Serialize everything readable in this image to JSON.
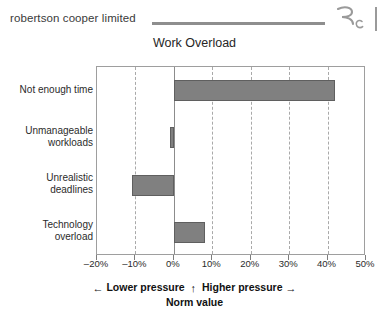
{
  "header": {
    "brand": "robertson cooper limited",
    "logo_letter_r": "R",
    "logo_letter_c": "C"
  },
  "chart_data": {
    "type": "bar",
    "orientation": "horizontal",
    "title": "Work Overload",
    "xlabel": "Norm value",
    "ylabel": "",
    "categories": [
      "Not enough time",
      "Unmanageable workloads",
      "Unrealistic deadlines",
      "Technology overload"
    ],
    "values": [
      42,
      -1,
      -11,
      8
    ],
    "xlim": [
      -20,
      50
    ],
    "xticks": [
      -20,
      -10,
      0,
      10,
      20,
      30,
      40,
      50
    ],
    "xticklabels": [
      "–20%",
      "–10%",
      "0%",
      "10%",
      "20%",
      "30%",
      "40%",
      "50%"
    ],
    "grid": true,
    "gridlines_at": [
      -10,
      10,
      20,
      30,
      40
    ],
    "legend": null,
    "bar_color": "#808080",
    "bar_edge_color": "#5f5f5f",
    "annotations": {
      "lower_pressure": "Lower pressure",
      "higher_pressure": "Higher pressure",
      "norm_value": "Norm value",
      "arrow_left": "←",
      "arrow_right": "→",
      "arrow_up": "↑"
    }
  }
}
